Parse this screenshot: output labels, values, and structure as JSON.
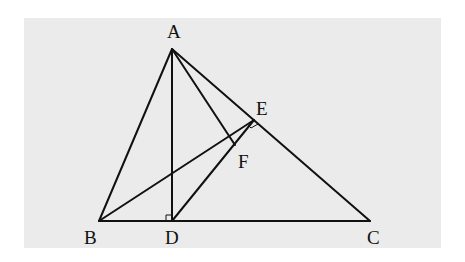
{
  "diagram": {
    "background": "#ebebeb",
    "stroke": "#111111",
    "points": {
      "A": {
        "label": "A",
        "x": 172,
        "y": 49,
        "lx": 167,
        "ly": 38
      },
      "B": {
        "label": "B",
        "x": 99,
        "y": 221,
        "lx": 84,
        "ly": 244
      },
      "C": {
        "label": "C",
        "x": 370,
        "y": 221,
        "lx": 367,
        "ly": 244
      },
      "D": {
        "label": "D",
        "x": 172,
        "y": 221,
        "lx": 165,
        "ly": 244
      },
      "E": {
        "label": "E",
        "x": 254,
        "y": 120,
        "lx": 256,
        "ly": 115
      },
      "F": {
        "label": "F",
        "x": 235,
        "y": 145,
        "lx": 238,
        "ly": 168
      }
    },
    "segments": [
      [
        "A",
        "B"
      ],
      [
        "A",
        "C"
      ],
      [
        "B",
        "C"
      ],
      [
        "A",
        "D"
      ],
      [
        "A",
        "F"
      ],
      [
        "B",
        "E"
      ],
      [
        "D",
        "E"
      ]
    ],
    "right_angles": [
      "D",
      "E"
    ]
  }
}
